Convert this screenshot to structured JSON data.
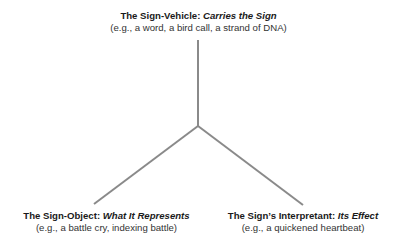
{
  "diagram": {
    "type": "triadic-sign-model",
    "colors": {
      "line": "#8a8a8a",
      "text": "#1a1a1a"
    },
    "nodes": {
      "top": {
        "title_prefix": "The Sign-Vehicle: ",
        "title_emphasis": "Carries the Sign",
        "example": "(e.g., a word, a bird call, a strand of DNA)"
      },
      "left": {
        "title_prefix": "The Sign-Object: ",
        "title_emphasis": "What It Represents",
        "example": "(e.g., a battle cry, indexing battle)"
      },
      "right": {
        "title_prefix": "The Sign’s Interpretant: ",
        "title_emphasis": "Its Effect",
        "example": "(e.g., a quickened heartbeat)"
      }
    },
    "edges": [
      {
        "from": "junction",
        "to": "top"
      },
      {
        "from": "junction",
        "to": "left"
      },
      {
        "from": "junction",
        "to": "right"
      }
    ]
  }
}
